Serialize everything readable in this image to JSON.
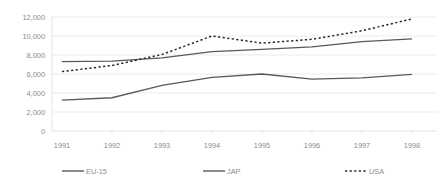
{
  "chart_data": {
    "type": "line",
    "title": "",
    "subtitle": "",
    "xlabel": "",
    "ylabel": "",
    "categories": [
      "1991",
      "1992",
      "1993",
      "1994",
      "1995",
      "1996",
      "1997",
      "1998"
    ],
    "x": [
      1991,
      1992,
      1993,
      1994,
      1995,
      1996,
      1997,
      1998
    ],
    "ylim": [
      0,
      12000
    ],
    "xlim": [
      1991,
      1998
    ],
    "yticks": [
      0,
      2000,
      4000,
      6000,
      8000,
      10000,
      12000
    ],
    "ytick_labels": [
      "0",
      "2,000",
      "4,000",
      "6,000",
      "8,000",
      "10,000",
      "12,000"
    ],
    "xtick_labels": [
      "1991",
      "1992",
      "1993",
      "1994",
      "1995",
      "1996",
      "1997",
      "1998"
    ],
    "grid": true,
    "grid_axis": "y",
    "legend_position": "bottom",
    "series": [
      {
        "name": "EU-15",
        "style": "solid",
        "color": "#595959",
        "values": [
          7300,
          7350,
          7700,
          8350,
          8600,
          8850,
          9400,
          9700
        ]
      },
      {
        "name": "JAP",
        "style": "solid",
        "color": "#595959",
        "values": [
          3250,
          3500,
          4800,
          5650,
          6000,
          5450,
          5600,
          5950
        ]
      },
      {
        "name": "USA",
        "style": "dotted",
        "color": "#262626",
        "values": [
          6250,
          6900,
          8050,
          10000,
          9250,
          9650,
          10550,
          11800
        ]
      }
    ]
  },
  "axis": {
    "y_labels": [
      "12,000",
      "10,000",
      "8,000",
      "6,000",
      "4,000",
      "2,000",
      "0"
    ],
    "x_labels": [
      "1991",
      "1992",
      "1993",
      "1994",
      "1995",
      "1996",
      "1997",
      "1998"
    ]
  },
  "legend": {
    "items": [
      {
        "label": "EU-15",
        "style": "solid"
      },
      {
        "label": "JAP",
        "style": "solid"
      },
      {
        "label": "USA",
        "style": "dotted"
      }
    ]
  },
  "colors": {
    "grid": "#e2e2e2",
    "axis": "#d9d9d9",
    "text": "#8c8c8c",
    "series_solid": "#595959",
    "series_dotted": "#262626",
    "background": "#ffffff"
  }
}
